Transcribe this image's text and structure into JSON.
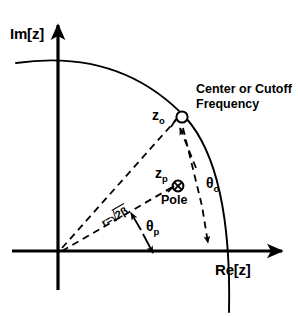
{
  "figure": {
    "name": "z-plane pole-zero diagram",
    "axes": {
      "imaginary_label": "Im[z]",
      "real_label": "Re[z]"
    },
    "annotations": {
      "zero_label": "z",
      "zero_subscript": "o",
      "zero_callout": "Center or Cutoff\nFrequency",
      "pole_label": "z",
      "pole_subscript": "p",
      "pole_caption": "Pole",
      "theta_zero": "θ",
      "theta_zero_subscript": "o",
      "theta_pole": "θ",
      "theta_pole_subscript": "p",
      "radius_prefix": "r=",
      "radius_radical": "√",
      "radius_radicand": "2β"
    },
    "markers": {
      "zero_marker": "open-circle",
      "pole_marker": "circled-x"
    },
    "colors": {
      "stroke": "#000000",
      "background": "#ffffff"
    }
  }
}
